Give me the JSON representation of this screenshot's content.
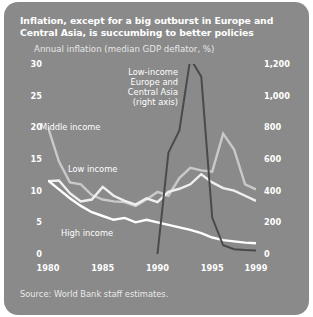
{
  "panel": {
    "background_color": "#8a8a8a",
    "title": "Inflation, except for a big outburst in Europe and Central Asia, is succumbing to better policies",
    "subtitle": "Annual inflation (median GDP deflator, %)",
    "source": "Source: World Bank staff estimates."
  },
  "chart_data": {
    "type": "line",
    "title": "Inflation, except for a big outburst in Europe and Central Asia, is succumbing to better policies",
    "subtitle": "Annual inflation (median GDP deflator, %)",
    "xlabel": "",
    "ylabel": "",
    "grid": false,
    "legend": "annotations-on-plot",
    "x": [
      1980,
      1981,
      1982,
      1983,
      1984,
      1985,
      1986,
      1987,
      1988,
      1989,
      1990,
      1991,
      1992,
      1993,
      1994,
      1995,
      1996,
      1997,
      1998,
      1999
    ],
    "xlim": [
      1980,
      1999
    ],
    "xticks": [
      1980,
      1985,
      1990,
      1995,
      1999
    ],
    "xticklabels": [
      "1980",
      "1985",
      "1990",
      "1995",
      "1999"
    ],
    "left_axis": {
      "label": "",
      "ylim": [
        0,
        30
      ],
      "yticks": [
        0,
        5,
        10,
        15,
        20,
        25,
        30
      ],
      "yticklabels": [
        "0",
        "5",
        "10",
        "15",
        "20",
        "25",
        "30"
      ]
    },
    "right_axis": {
      "label": "",
      "ylim": [
        0,
        1200
      ],
      "yticks": [
        0,
        200,
        400,
        600,
        800,
        1000,
        1200
      ],
      "yticklabels": [
        "0",
        "200",
        "400",
        "600",
        "800",
        "1,000",
        "1,200"
      ]
    },
    "series": [
      {
        "name": "Middle income",
        "axis": "left",
        "color": "#c9c9c9",
        "label_text": "Middle income",
        "values": [
          20.0,
          14.6,
          11.3,
          11.0,
          9.3,
          8.6,
          8.3,
          8.2,
          7.6,
          8.6,
          9.8,
          9.2,
          12.0,
          13.6,
          13.2,
          13.0,
          19.0,
          16.5,
          11.0,
          10.2
        ]
      },
      {
        "name": "Low income",
        "axis": "left",
        "color": "#efefef",
        "label_text": "Low income",
        "values": [
          11.5,
          11.6,
          9.6,
          8.3,
          8.6,
          10.6,
          9.2,
          8.4,
          7.8,
          8.8,
          8.2,
          9.8,
          10.3,
          11.0,
          12.6,
          11.3,
          10.4,
          10.0,
          9.2,
          8.4
        ]
      },
      {
        "name": "High income",
        "axis": "left",
        "color": "#ffffff",
        "label_text": "High income",
        "values": [
          11.6,
          10.2,
          8.8,
          7.6,
          6.6,
          6.0,
          5.4,
          5.7,
          5.0,
          5.4,
          5.0,
          4.6,
          4.2,
          3.8,
          3.3,
          2.6,
          2.2,
          2.0,
          1.8,
          1.7
        ]
      },
      {
        "name": "Low-income Europe and Central Asia",
        "axis": "right",
        "color": "#4a4a4a",
        "label_text": "Low-income Europe and Central Asia (right axis)",
        "note": "right axis",
        "x": [
          1990,
          1991,
          1992,
          1993,
          1994,
          1995,
          1996,
          1997,
          1998,
          1999
        ],
        "values": [
          0,
          640,
          780,
          1235,
          1120,
          230,
          55,
          30,
          25,
          22
        ]
      }
    ],
    "annotations": [
      {
        "text": "Middle income",
        "x": 1980.6,
        "y": 19.0,
        "axis": "left"
      },
      {
        "text": "Low income",
        "x": 1983.1,
        "y": 13.8,
        "axis": "left"
      },
      {
        "text": "High income",
        "x": 1982.6,
        "y": 3.2,
        "axis": "left"
      },
      {
        "text": "Low-income\nEurope and\nCentral Asia\n(right axis)",
        "x": 1990.6,
        "y": 29.0,
        "axis": "left"
      }
    ]
  },
  "annotations_text": {
    "middle_income": "Middle income",
    "low_income": "Low income",
    "high_income": "High income",
    "eca_line1": "Low-income",
    "eca_line2": "Europe and",
    "eca_line3": "Central Asia",
    "eca_line4": "(right axis)"
  }
}
